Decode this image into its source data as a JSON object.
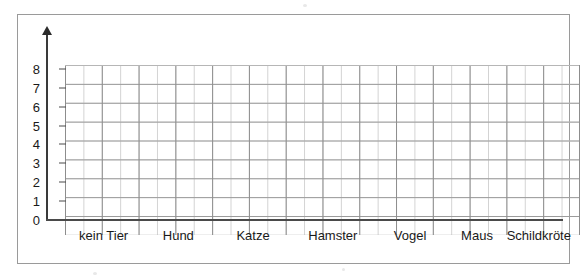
{
  "document": {
    "type": "blank-bar-chart-worksheet",
    "language": "de"
  },
  "chart_data": {
    "type": "bar",
    "title": "",
    "xlabel": "",
    "ylabel": "",
    "categories": [
      "kein Tier",
      "Hund",
      "Katze",
      "Hamster",
      "Vogel",
      "Maus",
      "Schildkröte"
    ],
    "values": [
      null,
      null,
      null,
      null,
      null,
      null,
      null
    ],
    "ylim": [
      0,
      9
    ],
    "yticks": [
      "0",
      "1",
      "2",
      "3",
      "4",
      "5",
      "6",
      "7",
      "8"
    ],
    "grid": true,
    "grid_columns": 28,
    "grid_rows": 9,
    "legend": null,
    "note": "Empty template grid — no bars drawn; axis arrow points up on the y-axis."
  },
  "axes": {
    "y": {
      "arrow_icon": "arrow-up-icon",
      "ticks": [
        {
          "label": "8",
          "value": 8
        },
        {
          "label": "7",
          "value": 7
        },
        {
          "label": "6",
          "value": 6
        },
        {
          "label": "5",
          "value": 5
        },
        {
          "label": "4",
          "value": 4
        },
        {
          "label": "3",
          "value": 3
        },
        {
          "label": "2",
          "value": 2
        },
        {
          "label": "1",
          "value": 1
        },
        {
          "label": "0",
          "value": 0
        }
      ]
    },
    "x": {
      "labels": [
        {
          "text": "kein Tier",
          "center_pct": 11.0
        },
        {
          "text": "Hund",
          "center_pct": 25.5
        },
        {
          "text": "Katze",
          "center_pct": 40.0
        },
        {
          "text": "Hamster",
          "center_pct": 55.5
        },
        {
          "text": "Vogel",
          "center_pct": 70.5
        },
        {
          "text": "Maus",
          "center_pct": 83.5
        },
        {
          "text": "Schildkröte",
          "center_pct": 95.5
        }
      ]
    }
  },
  "colors": {
    "frame": "#9a9a9a",
    "grid_minor": "#d6d6d6",
    "grid_major": "#8d8d8d",
    "axis": "#3a3a3a",
    "text": "#1a1a1a",
    "background": "#ffffff"
  }
}
